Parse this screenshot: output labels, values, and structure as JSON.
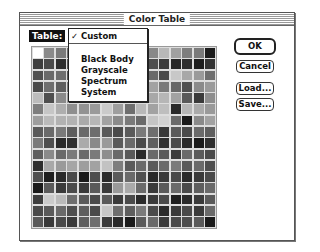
{
  "window": {
    "title": "Color Table"
  },
  "table_selector": {
    "label": "Table:",
    "selected": "Custom",
    "check_glyph": "✓",
    "menu_items": [
      {
        "label": "Custom",
        "checked": true
      },
      {
        "label": "Black Body",
        "checked": false
      },
      {
        "label": "Grayscale",
        "checked": false
      },
      {
        "label": "Spectrum",
        "checked": false
      },
      {
        "label": "System",
        "checked": false
      }
    ]
  },
  "buttons": {
    "ok": "OK",
    "cancel": "Cancel",
    "load": "Load...",
    "save": "Save..."
  },
  "color_grid": {
    "rows": 16,
    "cols": 16,
    "cells": [
      [
        "#ffffff",
        "#8a8a8a",
        "#7a7a7a",
        "#6e6e6e",
        "#8e8e8e",
        "#9a9a9a",
        "#8c8c8c",
        "#8a8a8a",
        "#7c7c7c",
        "#6a6a6a",
        "#888888",
        "#b8b8b8",
        "#a0a0a0",
        "#7e7e7e",
        "#7a7a7a",
        "#1c1c1c"
      ],
      [
        "#3e3e3e",
        "#4a4a4a",
        "#2e2e2e",
        "#5a5a5a",
        "#6a6a6a",
        "#707070",
        "#6c6c6c",
        "#5a5a5a",
        "#4a4a4a",
        "#3a3a3a",
        "#4e4e4e",
        "#3a3a3a",
        "#262626",
        "#2e2e2e",
        "#1e1e1e",
        "#333333"
      ],
      [
        "#505050",
        "#6a6a6a",
        "#6e6e6e",
        "#5a5a5a",
        "#707070",
        "#7a7a7a",
        "#6a6a6a",
        "#7a7a7a",
        "#8a8a8a",
        "#7a7a7a",
        "#6a6a6a",
        "#4a4a4a",
        "#c8c8c8",
        "#a8a8a8",
        "#9a9a9a",
        "#6e6e6e"
      ],
      [
        "#4a4a4a",
        "#6e6e6e",
        "#5e5e5e",
        "#7a7a7a",
        "#8a8a8a",
        "#9a9a9a",
        "#8e8e8e",
        "#a0a0a0",
        "#8a8a8a",
        "#7e7e7e",
        "#a2a2a2",
        "#7a7a7a",
        "#686868",
        "#505050",
        "#8a8a8a",
        "#9a9a9a"
      ],
      [
        "#bcbcbc",
        "#4e4e4e",
        "#8a8a8a",
        "#9a9a9a",
        "#b2b2b2",
        "#a6a6a6",
        "#9e9e9e",
        "#8a8a8a",
        "#9a9a9a",
        "#aaaaaa",
        "#a8a8a8",
        "#b6b6b6",
        "#a2a2a2",
        "#5a5a5a",
        "#3a3a3a",
        "#8e8e8e"
      ],
      [
        "#7e7e7e",
        "#c6c6c6",
        "#aeaeae",
        "#8e8e8e",
        "#929292",
        "#9a9a9a",
        "#cacaca",
        "#9e9e9e",
        "#6e6e6e",
        "#b8b8b8",
        "#a2a2a2",
        "#bebebe",
        "#2a2a2a",
        "#b6b6b6",
        "#aaaaaa",
        "#9a9a9a"
      ],
      [
        "#9e9e9e",
        "#bababa",
        "#b2b2b2",
        "#b2b2b2",
        "#aaaaaa",
        "#b6b6b6",
        "#a2a2a2",
        "#8a8a8a",
        "#7a7a7a",
        "#6a6a6a",
        "#c4c4c4",
        "#d2d2d2",
        "#6a6a6a",
        "#1a1a1a",
        "#8a8a8a",
        "#a2a2a2"
      ],
      [
        "#5a5a5a",
        "#6a6a6a",
        "#7a7a7a",
        "#5e5e5e",
        "#6a6a6a",
        "#6e6e6e",
        "#5a5a5a",
        "#4a4a4a",
        "#5a5a5a",
        "#7a7a7a",
        "#6e6e6e",
        "#3a3a3a",
        "#5a5a5a",
        "#4a4a4a",
        "#6a6a6a",
        "#5e5e5e"
      ],
      [
        "#7a7a7a",
        "#4e4e4e",
        "#2a2a2a",
        "#303030",
        "#aaaaaa",
        "#8a8a8a",
        "#9a9a9a",
        "#5a5a5a",
        "#6a6a6a",
        "#4a4a4a",
        "#5e5e5e",
        "#303030",
        "#4a4a4a",
        "#2a2a2a",
        "#1a1a1a",
        "#2e2e2e"
      ],
      [
        "#5e5e5e",
        "#8a8a8a",
        "#6a6a6a",
        "#7a7a7a",
        "#6a6a6a",
        "#7a7a7a",
        "#8e8e8e",
        "#6a6a6a",
        "#5a5a5a",
        "#2a2a2a",
        "#6a6a6a",
        "#5a5a5a",
        "#3a3a3a",
        "#6a6a6a",
        "#5a5a5a",
        "#4a4a4a"
      ],
      [
        "#2e2e2e",
        "#a8a8a8",
        "#9a9a9a",
        "#a6a6a6",
        "#9e9e9e",
        "#a2a2a2",
        "#c2c2c2",
        "#7e7e7e",
        "#5a5a5a",
        "#6a6a6a",
        "#5a5a5a",
        "#6a6a6a",
        "#7a7a7a",
        "#5a5a5a",
        "#6a6a6a",
        "#4e4e4e"
      ],
      [
        "#4e4e4e",
        "#1e1e1e",
        "#2a2a2a",
        "#4a4a4a",
        "#1a1a1a",
        "#4e4e4e",
        "#2a2a2a",
        "#5a5a5a",
        "#6a6a6a",
        "#505050",
        "#2a2a2a",
        "#3a3a3a",
        "#4a4a4a",
        "#2a2a2a",
        "#3a3a3a",
        "#4a4a4a"
      ],
      [
        "#1a1a1a",
        "#5a5a5a",
        "#3a3a3a",
        "#4a4a4a",
        "#3a3a3a",
        "#5a5a5a",
        "#3a3a3a",
        "#9a9a9a",
        "#aaaaaa",
        "#6a6a6a",
        "#3a3a3a",
        "#5a5a5a",
        "#6a6a6a",
        "#4a4a4a",
        "#5e5e5e",
        "#6a6a6a"
      ],
      [
        "#3e3e3e",
        "#cacaca",
        "#bababa",
        "#6e6e6e",
        "#5a5a5a",
        "#4a4a4a",
        "#5a5a5a",
        "#3a3a3a",
        "#4a4a4a",
        "#2a2a2a",
        "#3a3a3a",
        "#4a4a4a",
        "#1e1e1e",
        "#2a2a2a",
        "#3a3a3a",
        "#5a5a5a"
      ],
      [
        "#4a4a4a",
        "#5a5a5a",
        "#6a6a6a",
        "#4e4e4e",
        "#5e5e5e",
        "#4a4a4a",
        "#c6c6c6",
        "#6e6e6e",
        "#5e5e5e",
        "#7a7a7a",
        "#4a4a4a",
        "#2a2a2a",
        "#3a3a3a",
        "#4a4a4a",
        "#3a3a3a",
        "#6a6a6a"
      ],
      [
        "#5a5a5a",
        "#3a3a3a",
        "#4a4a4a",
        "#3a3a3a",
        "#5e5e5e",
        "#6e6e6e",
        "#3a3a3a",
        "#2a2a2a",
        "#1a1a1a",
        "#5a5a5a",
        "#6a6a6a",
        "#3a3a3a",
        "#4a4a4a",
        "#4e4e4e",
        "#5a5a5a",
        "#1a1a1a"
      ]
    ]
  }
}
